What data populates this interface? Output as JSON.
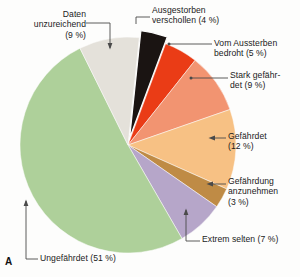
{
  "figure": {
    "panel_letter": "A",
    "background_color": "#fdfdfc"
  },
  "chart_data": {
    "type": "pie",
    "title": "",
    "subtitle": "",
    "xlabel": "",
    "ylabel": "",
    "legend_position": "callout-labels",
    "grid": false,
    "start_angle_deg": -84,
    "direction": "clockwise",
    "units": "%",
    "categories": [
      "Ausgestorben verschollen",
      "Vom Aussterben bedroht",
      "Stark gefährdet",
      "Gefährdet",
      "Gefährdung anzunehmen",
      "Extrem selten",
      "Ungefährdet",
      "Daten unzureichend"
    ],
    "values": [
      4,
      5,
      9,
      12,
      3,
      7,
      51,
      9
    ],
    "colors": [
      "#1a1412",
      "#ea3c16",
      "#f29471",
      "#f7c184",
      "#bf8b45",
      "#b6a6c9",
      "#aed09a",
      "#e4e1da"
    ],
    "exploded": [
      true,
      false,
      false,
      false,
      false,
      false,
      false,
      false
    ],
    "slices": [
      {
        "label": "Ausgestorben verschollen",
        "value": 4,
        "color": "#1a1412",
        "label_text": "Ausgestorben\nverschollen (4 %)"
      },
      {
        "label": "Vom Aussterben bedroht",
        "value": 5,
        "color": "#ea3c16",
        "label_text": "Vom Aussterben\nbedroht (5 %)"
      },
      {
        "label": "Stark gefährdet",
        "value": 9,
        "color": "#f29471",
        "label_text": "Stark gefähr-\ndet (9 %)"
      },
      {
        "label": "Gefährdet",
        "value": 12,
        "color": "#f7c184",
        "label_text": "Gefährdet\n(12 %)"
      },
      {
        "label": "Gefährdung anzunehmen",
        "value": 3,
        "color": "#bf8b45",
        "label_text": "Gefährdung\nanzunehmen\n(3 %)"
      },
      {
        "label": "Extrem selten",
        "value": 7,
        "color": "#b6a6c9",
        "label_text": "Extrem selten (7 %)"
      },
      {
        "label": "Ungefährdet",
        "value": 51,
        "color": "#aed09a",
        "label_text": "Ungefährdet  (51 %)"
      },
      {
        "label": "Daten unzureichend",
        "value": 9,
        "color": "#e4e1da",
        "label_text": "Daten\nunzureichend\n(9 %)"
      }
    ]
  },
  "labels": {
    "daten_unzureichend": "Daten\nunzureichend\n(9 %)",
    "ausgestorben_verschollen": "Ausgestorben\nverschollen (4 %)",
    "vom_aussterben_bedroht": "Vom Aussterben\nbedroht (5 %)",
    "stark_gefaehrdet": "Stark gefähr-\ndet (9 %)",
    "gefaehrdet": "Gefährdet\n(12 %)",
    "gefaehrdung_anzunehmen": "Gefährdung\nanzunehmen\n(3 %)",
    "extrem_selten": "Extrem selten (7 %)",
    "ungefaehrdet": "Ungefährdet  (51 %)"
  }
}
